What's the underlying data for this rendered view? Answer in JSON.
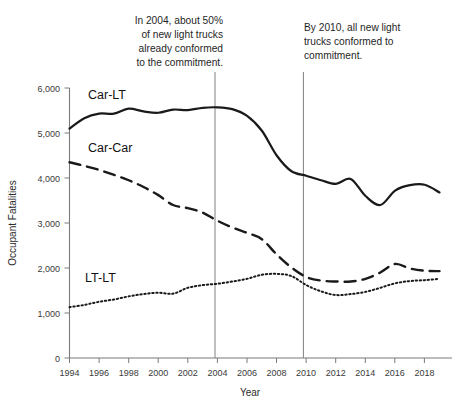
{
  "chart_data": {
    "type": "line",
    "title": "",
    "xlabel": "Year",
    "ylabel": "Occupant Fatalities",
    "xlim": [
      1994,
      2019
    ],
    "ylim": [
      0,
      6000
    ],
    "grid": false,
    "legend_position": "inline-labels",
    "x": [
      1994,
      1995,
      1996,
      1997,
      1998,
      1999,
      2000,
      2001,
      2002,
      2003,
      2004,
      2005,
      2006,
      2007,
      2008,
      2009,
      2010,
      2011,
      2012,
      2013,
      2014,
      2015,
      2016,
      2017,
      2018,
      2019
    ],
    "xtick_labels": [
      "1994",
      "1996",
      "1998",
      "2000",
      "2002",
      "2004",
      "2006",
      "2008",
      "2010",
      "2012",
      "2014",
      "2016",
      "2018"
    ],
    "xticks": [
      1994,
      1996,
      1998,
      2000,
      2002,
      2004,
      2006,
      2008,
      2010,
      2012,
      2014,
      2016,
      2018
    ],
    "ytick_labels": [
      "0",
      "1,000",
      "2,000",
      "3,000",
      "4,000",
      "5,000",
      "6,000"
    ],
    "yticks": [
      0,
      1000,
      2000,
      3000,
      4000,
      5000,
      6000
    ],
    "series": [
      {
        "name": "Car-LT",
        "label": "Car-LT",
        "style": "solid",
        "color": "#1a1a1a",
        "values": [
          5100,
          5330,
          5430,
          5430,
          5540,
          5480,
          5450,
          5520,
          5510,
          5560,
          5570,
          5530,
          5380,
          5050,
          4500,
          4150,
          4050,
          3950,
          3870,
          3980,
          3600,
          3400,
          3720,
          3840,
          3850,
          3680
        ]
      },
      {
        "name": "Car-Car",
        "label": "Car-Car",
        "style": "dashed",
        "color": "#1a1a1a",
        "values": [
          4350,
          4270,
          4180,
          4070,
          3950,
          3800,
          3620,
          3400,
          3330,
          3230,
          3050,
          2900,
          2780,
          2640,
          2300,
          2010,
          1800,
          1720,
          1700,
          1700,
          1760,
          1900,
          2090,
          1990,
          1940,
          1930
        ]
      },
      {
        "name": "LT-LT",
        "label": "LT-LT",
        "style": "dotted",
        "color": "#1a1a1a",
        "values": [
          1130,
          1180,
          1250,
          1300,
          1370,
          1420,
          1450,
          1430,
          1560,
          1620,
          1650,
          1700,
          1760,
          1850,
          1870,
          1820,
          1620,
          1480,
          1400,
          1420,
          1470,
          1560,
          1660,
          1710,
          1730,
          1760
        ]
      }
    ],
    "annotations": [
      {
        "id": "annotation-2004",
        "text": "In 2004, about 50% of new light trucks already conformed to the commitment.",
        "lines": [
          "In 2004, about 50%",
          "of new light trucks",
          "already conformed",
          "to the commitment."
        ],
        "vline_at_x": 2004
      },
      {
        "id": "annotation-2010",
        "text": "By 2010, all new light trucks conformed to commitment.",
        "lines": [
          "By 2010, all new light",
          "trucks conformed to",
          "commitment."
        ],
        "vline_at_x": 2010
      }
    ]
  }
}
